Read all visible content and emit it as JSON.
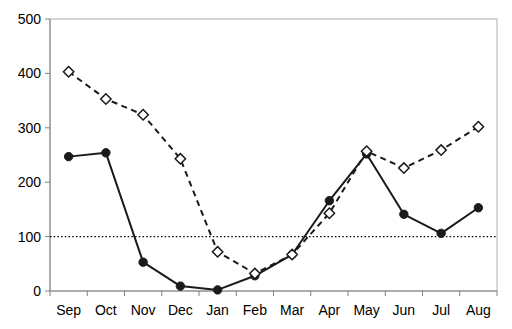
{
  "chart_data": {
    "type": "line",
    "title": "",
    "subtitle": "",
    "xlabel": "",
    "ylabel": "",
    "categories": [
      "Sep",
      "Oct",
      "Nov",
      "Dec",
      "Jan",
      "Feb",
      "Mar",
      "Apr",
      "May",
      "Jun",
      "Jul",
      "Aug"
    ],
    "series": [
      {
        "name": "solid-filled-circle-series",
        "marker": "filled-circle",
        "line_style": "solid",
        "color": "#1a1a1a",
        "values": [
          247,
          254,
          53,
          9,
          2,
          28,
          67,
          166,
          252,
          141,
          106,
          153
        ]
      },
      {
        "name": "dashed-open-diamond-series",
        "marker": "open-diamond",
        "line_style": "dashed",
        "color": "#1a1a1a",
        "values": [
          403,
          353,
          324,
          243,
          72,
          32,
          67,
          143,
          257,
          226,
          259,
          302
        ]
      }
    ],
    "ylim": [
      0,
      500
    ],
    "yticks": [
      0,
      100,
      200,
      300,
      400,
      500
    ],
    "ytick_labels": [
      "0",
      "100",
      "200",
      "300",
      "400",
      "500"
    ],
    "grid": false,
    "legend": "none",
    "annotations": [
      {
        "kind": "horizontal-reference-line",
        "value": 100,
        "style": "dotted",
        "color": "#000000"
      }
    ]
  },
  "axes": {
    "y_axis_name": "y-axis",
    "x_axis_name": "x-axis"
  }
}
